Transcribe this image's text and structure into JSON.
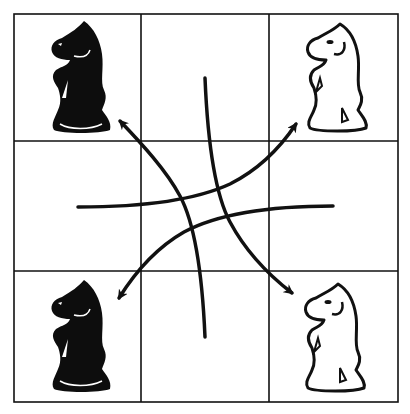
{
  "diagram": {
    "colors": {
      "ink": "#111111",
      "paper": "#ffffff",
      "white_piece_fill": "#ffffff",
      "black_piece_fill": "#0d0d0d"
    },
    "grid": {
      "rows": 3,
      "cols": 3,
      "x_lines": [
        14,
        141,
        269,
        398
      ],
      "y_lines": [
        14,
        141,
        271,
        402
      ]
    },
    "pieces": [
      {
        "id": "knight-top-left",
        "type": "knight",
        "color": "black",
        "square": "a3",
        "cx": 78,
        "cy": 78
      },
      {
        "id": "knight-top-right",
        "type": "knight",
        "color": "white",
        "square": "c3",
        "cx": 335,
        "cy": 78
      },
      {
        "id": "knight-bottom-left",
        "type": "knight",
        "color": "black",
        "square": "a1",
        "cx": 78,
        "cy": 337
      },
      {
        "id": "knight-bottom-right",
        "type": "knight",
        "color": "white",
        "square": "c1",
        "cx": 335,
        "cy": 337
      }
    ],
    "arrows": [
      {
        "id": "arrow-to-top-right",
        "from": [
          78,
          207
        ],
        "to": [
          299,
          119
        ],
        "head": "end"
      },
      {
        "id": "arrow-to-bottom-left",
        "from": [
          333,
          206
        ],
        "to": [
          116,
          302
        ],
        "head": "end"
      },
      {
        "id": "arrow-to-bottom-right",
        "from": [
          205,
          78
        ],
        "to": [
          296,
          297
        ],
        "head": "end"
      },
      {
        "id": "arrow-to-top-left",
        "from": [
          205,
          337
        ],
        "to": [
          117,
          117
        ],
        "head": "end"
      }
    ]
  }
}
